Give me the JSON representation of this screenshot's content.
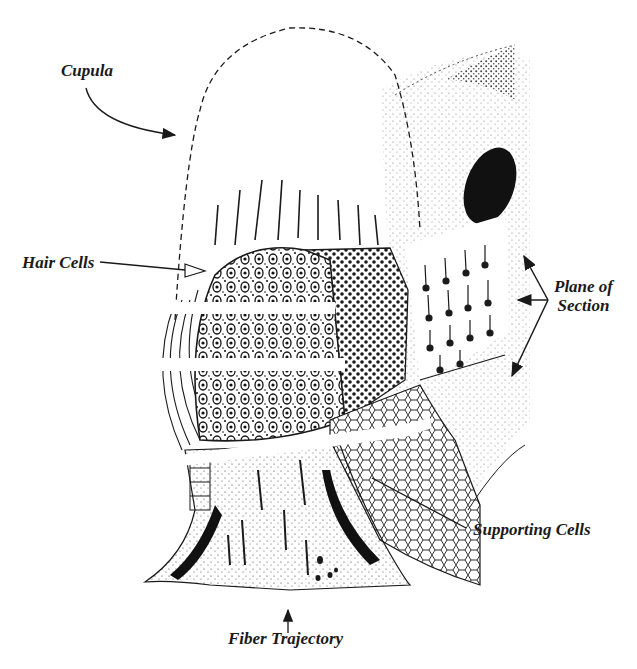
{
  "figure": {
    "colors": {
      "ink": "#1a1a1a",
      "background": "#ffffff"
    }
  },
  "labels": {
    "cupula": "Cupula",
    "hair_cells": "Hair Cells",
    "plane_of_section_line1": "Plane of",
    "plane_of_section_line2": "Section",
    "supporting_cells": "Supporting Cells",
    "fiber_trajectory": "Fiber Trajectory"
  }
}
